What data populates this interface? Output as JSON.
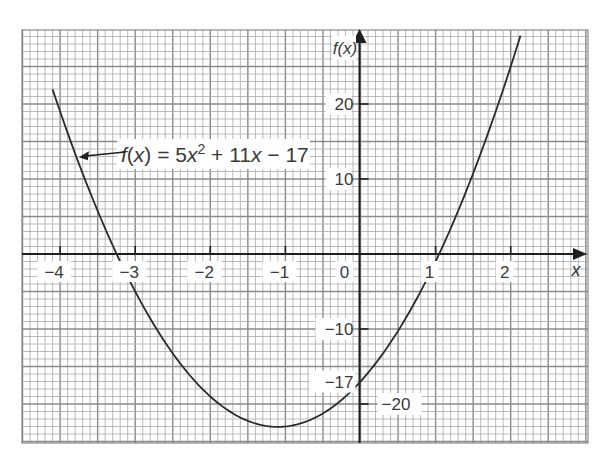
{
  "chart_data": {
    "type": "line",
    "title": "",
    "function": "f(x) = 5x^2 + 11x - 17",
    "coefficients": {
      "a": 5,
      "b": 11,
      "c": -17
    },
    "xlabel": "x",
    "ylabel": "f(x)",
    "xlim": [
      -4.5,
      3.0
    ],
    "ylim": [
      -25,
      30
    ],
    "x_ticks": [
      -4,
      -3,
      -2,
      -1,
      0,
      1,
      2
    ],
    "x_tick_labels": [
      "−4",
      "−3",
      "−2",
      "−1",
      "0",
      "1",
      "2"
    ],
    "y_ticks": [
      20,
      10,
      -10,
      -17,
      -20
    ],
    "y_tick_labels": [
      "20",
      "10",
      "−10",
      "−17",
      "−20"
    ],
    "grid": true,
    "series": [
      {
        "name": "f(x) = 5x² + 11x − 17",
        "x_range": [
          -4.1,
          2.13
        ],
        "x": [
          -4.1,
          -4,
          -3.5,
          -3.2,
          -3,
          -2.5,
          -2,
          -1.5,
          -1.1,
          -1,
          -0.5,
          0,
          0.5,
          1,
          1.5,
          2,
          2.13
        ],
        "y": [
          21.95,
          19,
          5.75,
          -0.6,
          -5,
          -13.25,
          -19,
          -22.25,
          -23.05,
          -23,
          -21.25,
          -17,
          -10.25,
          -1,
          10.75,
          25,
          29.1
        ]
      }
    ],
    "annotations": [
      {
        "text": "f(x) = 5x² + 11x − 17",
        "arrow_to": [
          -3.75,
          12.9
        ]
      },
      {
        "text": "−17",
        "at": [
          0,
          -17
        ],
        "note": "y-intercept"
      },
      {
        "text": "roots",
        "x": [
          -3.2,
          1.0
        ]
      }
    ],
    "vertex": {
      "x": -1.1,
      "y": -23.05
    }
  },
  "labels": {
    "y_axis_title": "f(x)",
    "x_axis_title": "x",
    "equation": {
      "lhs": "f(x)",
      "eq": " = 5",
      "var1": "x",
      "sup": "2",
      "rest1": " + 11",
      "var2": "x",
      "rest2": " − 17"
    }
  },
  "colors": {
    "grid_minor": "#a8a8a8",
    "grid_major": "#8a8a8a",
    "axis": "#1e1e1e",
    "curve": "#2a2a2a",
    "text": "#3a3a3a",
    "background": "#ffffff"
  }
}
